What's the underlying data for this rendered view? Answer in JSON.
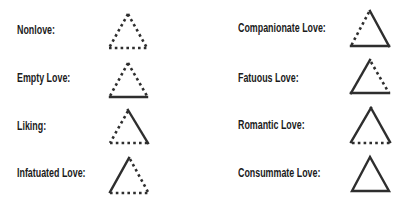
{
  "line_styles": {
    "solid": "component present",
    "dotted": "component absent"
  },
  "colors": {
    "text": "#1b1b1b",
    "line": "#2e2e2e",
    "background": "#ffffff"
  },
  "items": [
    {
      "label": "Nonlove:",
      "left": "dotted",
      "right": "dotted",
      "base": "dotted"
    },
    {
      "label": "Empty Love:",
      "left": "dotted",
      "right": "dotted",
      "base": "solid"
    },
    {
      "label": "Liking:",
      "left": "dotted",
      "right": "solid",
      "base": "dotted"
    },
    {
      "label": "Infatuated Love:",
      "left": "solid",
      "right": "dotted",
      "base": "dotted"
    },
    {
      "label": "Companionate Love:",
      "left": "dotted",
      "right": "solid",
      "base": "solid"
    },
    {
      "label": "Fatuous Love:",
      "left": "solid",
      "right": "dotted",
      "base": "solid"
    },
    {
      "label": "Romantic Love:",
      "left": "solid",
      "right": "solid",
      "base": "dotted"
    },
    {
      "label": "Consummate Love:",
      "left": "solid",
      "right": "solid",
      "base": "solid"
    }
  ]
}
